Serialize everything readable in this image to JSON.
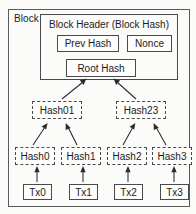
{
  "diagram": {
    "title": "Block",
    "block_label": "Block",
    "header": {
      "title": "Block Header (Block Hash)",
      "fields": [
        {
          "name": "prev-hash",
          "label": "Prev Hash"
        },
        {
          "name": "nonce",
          "label": "Nonce"
        },
        {
          "name": "root-hash",
          "label": "Root Hash"
        }
      ]
    },
    "merkle_tree": {
      "internal_nodes": [
        {
          "name": "hash01",
          "label": "Hash01"
        },
        {
          "name": "hash23",
          "label": "Hash23"
        }
      ],
      "leaf_hashes": [
        {
          "name": "hash0",
          "label": "Hash0"
        },
        {
          "name": "hash1",
          "label": "Hash1"
        },
        {
          "name": "hash2",
          "label": "Hash2"
        },
        {
          "name": "hash3",
          "label": "Hash3"
        }
      ],
      "transactions": [
        {
          "name": "tx0",
          "label": "Tx0"
        },
        {
          "name": "tx1",
          "label": "Tx1"
        },
        {
          "name": "tx2",
          "label": "Tx2"
        },
        {
          "name": "tx3",
          "label": "Tx3"
        }
      ]
    },
    "colors": {
      "background": "#fbfbfa",
      "border": "#4a4a4a",
      "outer_border": "#5b5b5b",
      "arrow": "#2c2c2c",
      "text": "#1b1b1b"
    },
    "edges": [
      {
        "from": "hash01",
        "to": "root-hash"
      },
      {
        "from": "hash23",
        "to": "root-hash"
      },
      {
        "from": "hash0",
        "to": "hash01"
      },
      {
        "from": "hash1",
        "to": "hash01"
      },
      {
        "from": "hash2",
        "to": "hash23"
      },
      {
        "from": "hash3",
        "to": "hash23"
      },
      {
        "from": "tx0",
        "to": "hash0"
      },
      {
        "from": "tx1",
        "to": "hash1"
      },
      {
        "from": "tx2",
        "to": "hash2"
      },
      {
        "from": "tx3",
        "to": "hash3"
      }
    ]
  }
}
